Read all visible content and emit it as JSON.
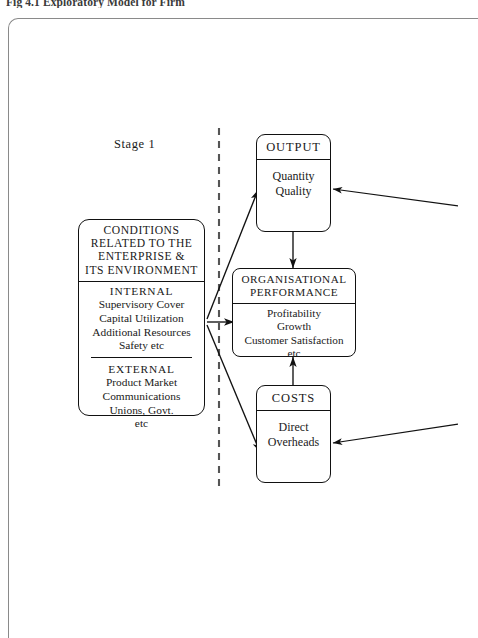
{
  "figure": {
    "caption": "Fig 4.1 Exploratory Model for Firm",
    "stage_label": "Stage 1"
  },
  "colors": {
    "ink": "#111111",
    "paper": "#ffffff",
    "frame": "#8a8a8a",
    "divider_dash": "#555555"
  },
  "boxes": {
    "conditions": {
      "header_lines": [
        "CONDITIONS",
        "RELATED TO THE",
        "ENTERPRISE &",
        "ITS ENVIRONMENT"
      ],
      "internal": {
        "title": "INTERNAL",
        "items": [
          "Supervisory Cover",
          "Capital Utilization",
          "Additional Resources",
          "Safety etc"
        ]
      },
      "external": {
        "title": "EXTERNAL",
        "items": [
          "Product Market",
          "Communications",
          "Unions, Govt.",
          "etc"
        ]
      }
    },
    "output": {
      "header": "OUTPUT",
      "items": [
        "Quantity",
        "Quality"
      ]
    },
    "organisational_performance": {
      "header_lines": [
        "ORGANISATIONAL",
        "PERFORMANCE"
      ],
      "items": [
        "Profitability",
        "Growth",
        "Customer Satisfaction",
        "etc"
      ]
    },
    "costs": {
      "header": "COSTS",
      "items": [
        "Direct",
        "Overheads"
      ]
    }
  },
  "connectors": [
    {
      "name": "conditions-to-output",
      "from": "conditions",
      "to": "output",
      "style": "solid-arrow"
    },
    {
      "name": "conditions-to-organisational-performance",
      "from": "conditions",
      "to": "organisational_performance",
      "style": "solid-arrow"
    },
    {
      "name": "conditions-to-costs",
      "from": "conditions",
      "to": "costs",
      "style": "solid-arrow"
    },
    {
      "name": "output-to-organisational-performance",
      "from": "output",
      "to": "organisational_performance",
      "style": "solid-arrow"
    },
    {
      "name": "costs-to-organisational-performance",
      "from": "costs",
      "to": "organisational_performance",
      "style": "solid-arrow"
    },
    {
      "name": "external-input-to-output",
      "from": "offpage-right",
      "to": "output",
      "style": "solid-arrow"
    },
    {
      "name": "external-input-to-costs",
      "from": "offpage-right",
      "to": "costs",
      "style": "solid-arrow"
    },
    {
      "name": "stage-divider",
      "style": "vertical-dashed"
    }
  ]
}
